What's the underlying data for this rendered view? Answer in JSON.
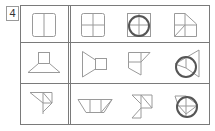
{
  "question_number": "4",
  "colors": {
    "grid_line": "#7a7a7a",
    "shape_line": "#9a9a9a",
    "circle_line": "#555555",
    "background": "#ffffff"
  },
  "grid": {
    "rows": 3,
    "left_column": [
      "two-panel-square",
      "trapezoid-with-square-top",
      "folded-triangle-shape"
    ],
    "right_section": [
      [
        "four-panel-square",
        "four-panel-square-with-circle",
        "square-with-cut-corner-and-diagonal"
      ],
      [
        "trapezoid-with-square-right",
        "folded-square-shape",
        "cone-with-circle"
      ],
      [
        "inverted-trapezoid-with-divisions",
        "zigzag-triangles",
        "folded-square-with-circle"
      ]
    ]
  }
}
